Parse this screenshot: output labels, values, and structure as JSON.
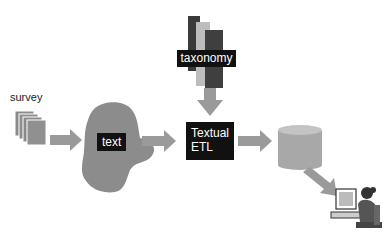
{
  "diagram": {
    "nodes": {
      "survey": {
        "label": "survey"
      },
      "text": {
        "label": "text"
      },
      "taxonomy": {
        "label": "taxonomy"
      },
      "textual_etl": {
        "label_line1": "Textual",
        "label_line2": "ETL"
      },
      "database": {
        "label": ""
      },
      "user": {
        "label": ""
      }
    },
    "edges": [
      {
        "from": "survey",
        "to": "text"
      },
      {
        "from": "text",
        "to": "textual_etl"
      },
      {
        "from": "taxonomy",
        "to": "textual_etl"
      },
      {
        "from": "textual_etl",
        "to": "database"
      },
      {
        "from": "database",
        "to": "user"
      }
    ],
    "colors": {
      "arrow": "#9a9a9a",
      "blob": "#8c8c8c",
      "label_bg": "#111111",
      "label_text": "#ffffff",
      "db_body": "#a8a8a8",
      "db_top": "#c4c4c4"
    }
  }
}
